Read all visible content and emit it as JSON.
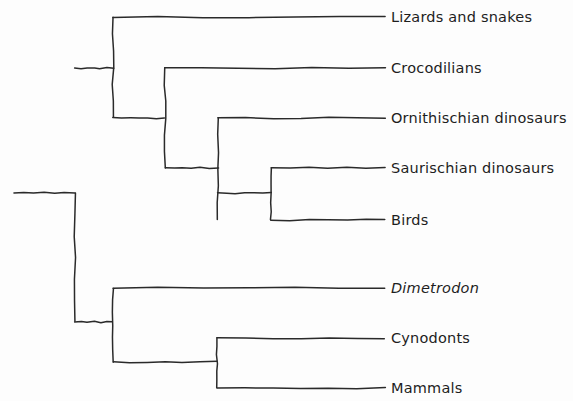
{
  "figure": {
    "kind": "cladogram",
    "style": "hand-drawn phylogenetic tree, black ink on white paper",
    "background_color": "#fdfdfd",
    "line_color": "#2a2a2a"
  },
  "taxa": [
    {
      "id": "lizards-and-snakes",
      "label": "Lizards and snakes",
      "italic": false,
      "row_y": 17,
      "branch_x": 113,
      "tip_x": 385,
      "label_x": 391
    },
    {
      "id": "crocodilians",
      "label": "Crocodilians",
      "italic": false,
      "row_y": 68,
      "branch_x": 165,
      "tip_x": 385,
      "label_x": 391
    },
    {
      "id": "ornithischian-dinosaurs",
      "label": "Ornithischian dinosaurs",
      "italic": false,
      "row_y": 118,
      "branch_x": 218,
      "tip_x": 385,
      "label_x": 391
    },
    {
      "id": "saurischian-dinosaurs",
      "label": "Saurischian dinosaurs",
      "italic": false,
      "row_y": 168,
      "branch_x": 271,
      "tip_x": 385,
      "label_x": 391
    },
    {
      "id": "birds",
      "label": "Birds",
      "italic": false,
      "row_y": 220,
      "branch_x": 271,
      "tip_x": 385,
      "label_x": 391
    },
    {
      "id": "dimetrodon",
      "label": "Dimetrodon",
      "italic": true,
      "row_y": 288,
      "branch_x": 113,
      "tip_x": 385,
      "label_x": 391
    },
    {
      "id": "cynodonts",
      "label": "Cynodonts",
      "italic": false,
      "row_y": 338,
      "branch_x": 217,
      "tip_x": 385,
      "label_x": 391
    },
    {
      "id": "mammals",
      "label": "Mammals",
      "italic": false,
      "row_y": 388,
      "branch_x": 217,
      "tip_x": 385,
      "label_x": 391
    }
  ],
  "nodes": [
    {
      "id": "root-node",
      "x": 75,
      "y_top": 193,
      "y_bottom": 322,
      "stem_from_x": 14,
      "stem_y": 193
    },
    {
      "id": "reptile-node",
      "x": 113,
      "y_top": 17,
      "y_bottom": 118,
      "stem_from_x": 75,
      "stem_y": 68
    },
    {
      "id": "archosaur-node",
      "x": 165,
      "y_top": 68,
      "y_bottom": 168,
      "stem_from_x": 113,
      "stem_y": 118
    },
    {
      "id": "dinosaur-node",
      "x": 218,
      "y_top": 118,
      "y_bottom": 220,
      "stem_from_x": 165,
      "stem_y": 168
    },
    {
      "id": "saurischian-node",
      "x": 271,
      "y_top": 168,
      "y_bottom": 220,
      "stem_from_x": 218,
      "stem_y": 193
    },
    {
      "id": "synapsid-node",
      "x": 113,
      "y_top": 288,
      "y_bottom": 362,
      "stem_from_x": 75,
      "stem_y": 322
    },
    {
      "id": "cynodont-mammal-node",
      "x": 217,
      "y_top": 338,
      "y_bottom": 388,
      "stem_from_x": 113,
      "stem_y": 362
    }
  ]
}
